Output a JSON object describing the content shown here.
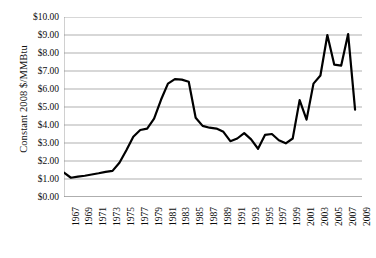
{
  "chart_data": {
    "type": "line",
    "title": "",
    "subtitle": "",
    "xlabel": "",
    "ylabel": "Constant 2008 $/MMBtu",
    "xlim": [
      1967,
      2010
    ],
    "ylim": [
      0,
      10
    ],
    "grid": true,
    "grid_axis": "y",
    "legend": false,
    "legend_position": "none",
    "y_ticks": [
      0,
      1,
      2,
      3,
      4,
      5,
      6,
      7,
      8,
      9,
      10
    ],
    "y_tick_labels": [
      "$0.00",
      "$1.00",
      "$2.00",
      "$3.00",
      "$4.00",
      "$5.00",
      "$6.00",
      "$7.00",
      "$8.00",
      "$9.00",
      "$10.00"
    ],
    "x_ticks": [
      1967,
      1969,
      1971,
      1973,
      1975,
      1977,
      1979,
      1981,
      1983,
      1985,
      1987,
      1989,
      1991,
      1993,
      1995,
      1997,
      1999,
      2001,
      2003,
      2005,
      2007,
      2009
    ],
    "x_tick_labels": [
      "1967",
      "1969",
      "1971",
      "1973",
      "1975",
      "1977",
      "1979",
      "1981",
      "1983",
      "1985",
      "1987",
      "1989",
      "1991",
      "1993",
      "1995",
      "1997",
      "1999",
      "2001",
      "2003",
      "2005",
      "2007",
      "2009"
    ],
    "series": [
      {
        "name": "Constant 2008 $/MMBtu",
        "color": "#000000",
        "line_width": 2.2,
        "x": [
          1967,
          1968,
          1969,
          1970,
          1971,
          1972,
          1973,
          1974,
          1975,
          1976,
          1977,
          1978,
          1979,
          1980,
          1981,
          1982,
          1983,
          1984,
          1985,
          1986,
          1987,
          1988,
          1989,
          1990,
          1991,
          1992,
          1993,
          1994,
          1995,
          1996,
          1997,
          1998,
          1999,
          2000,
          2001,
          2002,
          2003,
          2004,
          2005,
          2006,
          2007,
          2008,
          2009
        ],
        "values": [
          1.35,
          1.07,
          1.13,
          1.18,
          1.25,
          1.32,
          1.4,
          1.45,
          1.9,
          2.6,
          3.35,
          3.72,
          3.8,
          4.35,
          5.4,
          6.3,
          6.55,
          6.52,
          6.4,
          4.4,
          3.95,
          3.85,
          3.8,
          3.62,
          3.1,
          3.25,
          3.55,
          3.2,
          2.68,
          3.45,
          3.5,
          3.15,
          2.98,
          3.25,
          5.38,
          4.3,
          6.3,
          6.75,
          9.0,
          7.35,
          7.3,
          9.05,
          4.85
        ]
      }
    ]
  },
  "axis": {
    "y_axis_title": "Constant 2008 $/MMBtu"
  }
}
